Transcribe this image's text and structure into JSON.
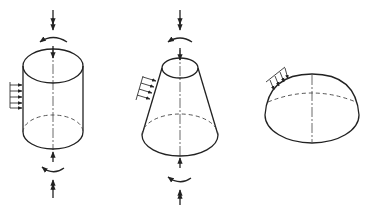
{
  "diagram": {
    "figures": [
      {
        "name": "cylinder",
        "loads": [
          "axial-force-top",
          "torque-top",
          "lateral-pressure",
          "torque-bottom",
          "axial-force-bottom"
        ]
      },
      {
        "name": "truncated-cone",
        "loads": [
          "axial-force-top",
          "torque-top",
          "normal-pressure",
          "torque-bottom",
          "axial-force-bottom"
        ]
      },
      {
        "name": "hemisphere",
        "loads": [
          "normal-pressure"
        ]
      }
    ],
    "colors": {
      "line": "#222222",
      "background": "#ffffff"
    }
  }
}
